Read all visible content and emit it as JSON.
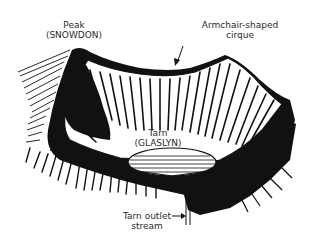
{
  "diagram": {
    "labels": {
      "peak": {
        "line1": "Peak",
        "line2": "(SNOWDON)"
      },
      "cirque": {
        "line1": "Armchair-shaped",
        "line2": "cirque"
      },
      "tarn": {
        "line1": "Tarn",
        "line2": "(GLASLYN)"
      },
      "outlet": {
        "line1": "Tarn outlet",
        "line2": "stream"
      }
    },
    "colors": {
      "ink": "#111111",
      "paper": "#ffffff",
      "text": "#2a2a2a"
    }
  }
}
